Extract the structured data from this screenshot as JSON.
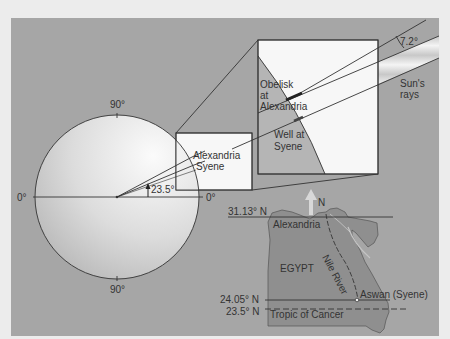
{
  "colors": {
    "page_background": "#ececec",
    "panel": "#a6a6a6",
    "globe_light": "#f2f2f2",
    "globe_dark": "#b8b8b8",
    "zoom_box": "#f7f7f7",
    "earth_segment": "#b5b5b5",
    "egypt": "#8f8f8f",
    "line": "#333333",
    "rays_light": "#f0f0f0"
  },
  "globe": {
    "label_top": "90°",
    "label_bottom": "90°",
    "label_left": "0°",
    "label_right": "0°",
    "angle_label": "23.5°",
    "city_label_1": "Alexandria",
    "city_label_2": "Syene"
  },
  "zoom_box": {
    "obelisk_label_line1": "Obelisk",
    "obelisk_label_line2": "at",
    "obelisk_label_line3": "Alexandria",
    "well_label_line1": "Well at",
    "well_label_line2": "Syene"
  },
  "sun": {
    "angle_label": "7.2°",
    "rays_label_line1": "Sun's",
    "rays_label_line2": "rays"
  },
  "map": {
    "north_label": "N",
    "country_label": "EGYPT",
    "river_label": "Nile River",
    "city_north": "Alexandria",
    "city_south": "Aswan (Syene)",
    "lat_alexandria": "31.13° N",
    "lat_aswan": "24.05° N",
    "lat_tropic": "23.5° N",
    "tropic_label": "Tropic of Cancer"
  }
}
